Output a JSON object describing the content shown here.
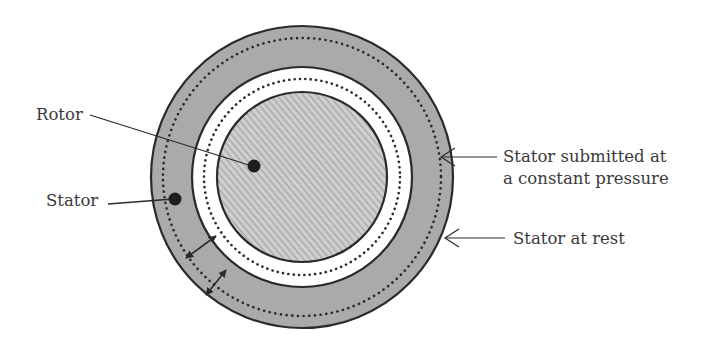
{
  "diagram": {
    "type": "cross-section",
    "colors": {
      "stator_fill": "#aaaaaa",
      "gap_fill": "#ffffff",
      "rotor_fill": "#cfcfcf",
      "rotor_hatch": "#b2b2b2",
      "outline": "#2a2a2a",
      "text": "#3a3a3a"
    },
    "labels": {
      "rotor": "Rotor",
      "stator": "Stator",
      "stator_pressure_line1": "Stator submitted at",
      "stator_pressure_line2": "a constant pressure",
      "stator_rest": "Stator at rest"
    },
    "components": [
      {
        "name": "stator",
        "description": "Outer gray annulus"
      },
      {
        "name": "stator-at-rest-boundary",
        "description": "Outer solid circle"
      },
      {
        "name": "stator-pressurized-boundary",
        "description": "Outer dotted circle"
      },
      {
        "name": "clearance-gap",
        "description": "White annulus between stator and rotor"
      },
      {
        "name": "rotor-displaced-boundary",
        "description": "Inner dotted circle"
      },
      {
        "name": "rotor",
        "description": "Hatched inner disk"
      },
      {
        "name": "clearance-arrows",
        "count": 2,
        "description": "Double-headed arrows indicating gap/deformation"
      }
    ]
  }
}
